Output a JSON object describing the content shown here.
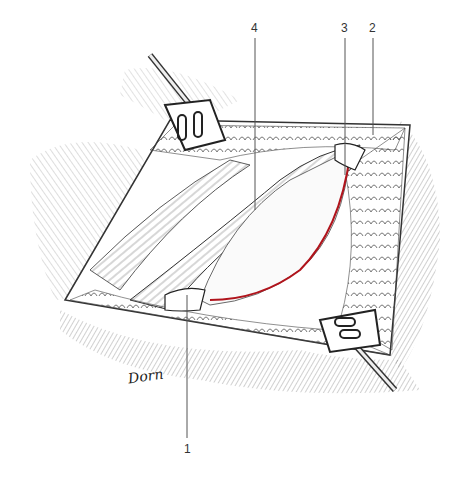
{
  "figure": {
    "type": "surgical illustration",
    "signature": "Dorn",
    "accent_color": "#b0141c",
    "labels": [
      {
        "id": "1",
        "text": "1"
      },
      {
        "id": "2",
        "text": "2"
      },
      {
        "id": "3",
        "text": "3"
      },
      {
        "id": "4",
        "text": "4"
      }
    ]
  }
}
